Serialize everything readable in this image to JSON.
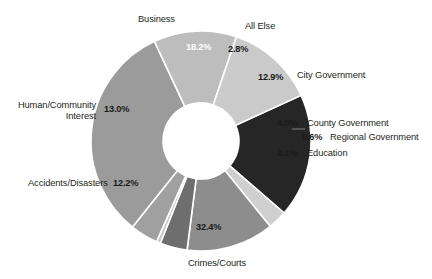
{
  "chart_data": {
    "type": "pie",
    "variant": "donut",
    "title": "",
    "subtitle": "",
    "xlabel": "",
    "ylabel": "",
    "units": "percent",
    "grid": false,
    "legend": "none",
    "label_style": "outside-callout",
    "total_label": "100%",
    "categories": [
      "Business",
      "All Else",
      "City Government",
      "County Government",
      "Regional Government",
      "Education",
      "Crimes/Courts",
      "Accidents/Disasters",
      "Human/Community Interest"
    ],
    "values": [
      18.2,
      2.8,
      12.9,
      4.0,
      0.6,
      4.1,
      32.4,
      12.2,
      13.0
    ],
    "value_labels": [
      "18.2%",
      "2.8%",
      "12.9%",
      "4.0%",
      "0.6%",
      "4.1%",
      "32.4%",
      "12.2%",
      "13.0%"
    ],
    "colors": [
      "#262626",
      "#cfcfcf",
      "#8d8d8d",
      "#6e6e6e",
      "#c9c9c9",
      "#a0a0a0",
      "#9b9b9b",
      "#bdbdbd",
      "#cacaca"
    ],
    "label_colors": [
      "#ffffff",
      "#1a1a1a",
      "#1a1a1a",
      "#1a1a1a",
      "#1a1a1a",
      "#1a1a1a",
      "#1a1a1a",
      "#1a1a1a",
      "#1a1a1a"
    ],
    "geometry": {
      "center_x": 201,
      "center_y": 141,
      "outer_radius": 110,
      "inner_radius": 38,
      "start_angle_deg": -24.5,
      "direction": "clockwise",
      "separator_color": "#ffffff",
      "separator_width": 1.6
    },
    "background": "#ffffff"
  },
  "slices": {
    "business": {
      "label": "Business",
      "pct": "18.2%"
    },
    "all_else": {
      "label": "All Else",
      "pct": "2.8%"
    },
    "city_government": {
      "label": "City Government",
      "pct": "12.9%"
    },
    "county_government": {
      "label": "County Government",
      "pct": "4.0%"
    },
    "regional_government": {
      "label": "Regional Government",
      "pct": "0.6%"
    },
    "education": {
      "label": "Education",
      "pct": "4.1%"
    },
    "crimes_courts": {
      "label": "Crimes/Courts",
      "pct": "32.4%"
    },
    "accidents_disasters": {
      "label": "Accidents/Disasters",
      "pct": "12.2%"
    },
    "human_community_interest": {
      "label": "Human/Community Interest",
      "pct": "13.0%"
    }
  }
}
